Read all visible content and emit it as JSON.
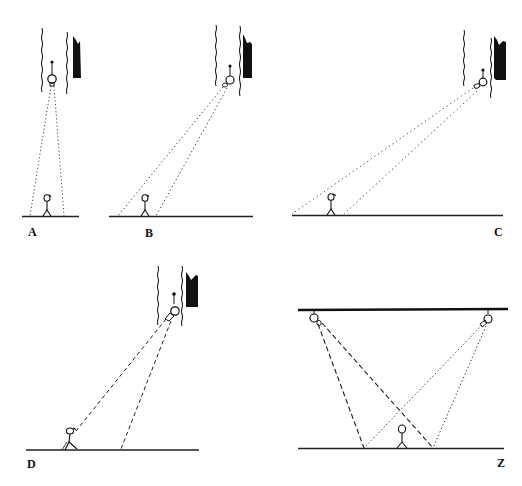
{
  "figure": {
    "colors": {
      "ink": "#111111",
      "ray": "#333333",
      "background": "#ffffff"
    }
  },
  "panels": [
    {
      "id": "A",
      "label": "A",
      "view": "camera pointing straight down",
      "ray_style": "dotted"
    },
    {
      "id": "B",
      "label": "B",
      "view": "camera angled moderately",
      "ray_style": "dotted"
    },
    {
      "id": "C",
      "label": "C",
      "view": "camera angled steeply toward far ground",
      "ray_style": "dotted"
    },
    {
      "id": "D",
      "label": "D",
      "view": "camera angled with wide dashed rays",
      "ray_style": "dashed"
    },
    {
      "id": "Z",
      "label": "Z",
      "view": "two ceiling cameras with crossing fields of view",
      "ray_style": "dashed+dotted"
    }
  ]
}
